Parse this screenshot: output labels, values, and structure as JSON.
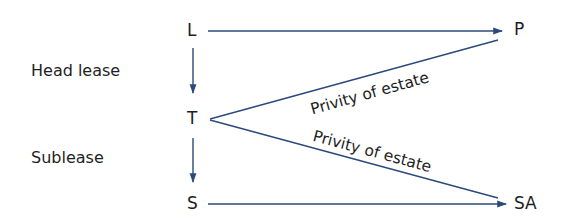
{
  "diagram": {
    "type": "lease-privity-diagram",
    "side_labels": {
      "head_lease": "Head lease",
      "sublease": "Sublease"
    },
    "nodes": {
      "L": "L",
      "T": "T",
      "S": "S",
      "P": "P",
      "SA": "SA"
    },
    "edges": [
      {
        "from": "L",
        "to": "P",
        "style": "arrow"
      },
      {
        "from": "L",
        "to": "T",
        "style": "arrow"
      },
      {
        "from": "T",
        "to": "S",
        "style": "arrow"
      },
      {
        "from": "S",
        "to": "SA",
        "style": "arrow"
      },
      {
        "from": "T",
        "to": "P",
        "style": "line",
        "label": "Privity of estate"
      },
      {
        "from": "T",
        "to": "SA",
        "style": "line",
        "label": "Privity of estate"
      }
    ],
    "edge_labels": {
      "t_to_p": "Privity of estate",
      "t_to_sa": "Privity of estate"
    },
    "colors": {
      "line": "#2b4a7a",
      "text": "#1e1e1e",
      "background": "#ffffff"
    }
  }
}
